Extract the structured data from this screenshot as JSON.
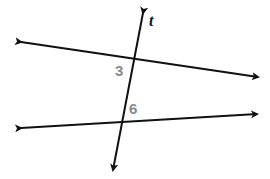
{
  "diagram": {
    "transversal_label": "t",
    "angle_labels": [
      "3",
      "6"
    ],
    "colors": {
      "line": "#111111",
      "angle_label": "#8a8a8a",
      "background": "#ffffff"
    },
    "lines": [
      {
        "name": "upper-line",
        "x1": 21,
        "y1": 42,
        "x2": 258,
        "y2": 77
      },
      {
        "name": "lower-line",
        "x1": 21,
        "y1": 128,
        "x2": 257,
        "y2": 114
      },
      {
        "name": "transversal-t",
        "x1": 143,
        "y1": 13,
        "x2": 113,
        "y2": 170
      }
    ]
  }
}
